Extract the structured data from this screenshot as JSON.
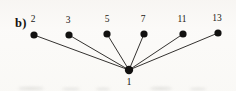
{
  "figure": {
    "panel_label": "b)",
    "panel_label_x": 15,
    "panel_label_y": 17,
    "background_color": "#fbfaf8",
    "ink_color": "#121110",
    "edge_color": "#1d1b18"
  },
  "graph_data": {
    "type": "star-graph",
    "description": "Star graph with center vertex 1 connected to six leaf vertices",
    "center": {
      "id": "center",
      "label": "1",
      "x": 129,
      "y": 70,
      "radius": 4.2,
      "label_x": 129,
      "label_y": 81.5
    },
    "leaves": [
      {
        "id": "leaf-2",
        "label": "2",
        "x": 34,
        "y": 35,
        "radius": 3.6,
        "label_x": 33,
        "label_y": 20
      },
      {
        "id": "leaf-3",
        "label": "3",
        "x": 69,
        "y": 35,
        "radius": 3.6,
        "label_x": 68,
        "label_y": 21
      },
      {
        "id": "leaf-5",
        "label": "5",
        "x": 107,
        "y": 34,
        "radius": 3.6,
        "label_x": 107,
        "label_y": 20
      },
      {
        "id": "leaf-7",
        "label": "7",
        "x": 144,
        "y": 34,
        "radius": 3.6,
        "label_x": 143,
        "label_y": 20
      },
      {
        "id": "leaf-11",
        "label": "11",
        "x": 183,
        "y": 34,
        "radius": 3.6,
        "label_x": 182,
        "label_y": 20
      },
      {
        "id": "leaf-13",
        "label": "13",
        "x": 218,
        "y": 33,
        "radius": 3.6,
        "label_x": 217,
        "label_y": 19
      }
    ],
    "edges": [
      {
        "id": "edge-1-2",
        "from": "1",
        "to": "2"
      },
      {
        "id": "edge-1-3",
        "from": "1",
        "to": "3"
      },
      {
        "id": "edge-1-5",
        "from": "1",
        "to": "5"
      },
      {
        "id": "edge-1-7",
        "from": "1",
        "to": "7"
      },
      {
        "id": "edge-1-11",
        "from": "1",
        "to": "11"
      },
      {
        "id": "edge-1-13",
        "from": "1",
        "to": "13"
      }
    ],
    "edge_width": 0.9,
    "vertex_labels": [
      "1",
      "2",
      "3",
      "5",
      "7",
      "11",
      "13"
    ]
  },
  "artifacts": [
    {
      "x": 18,
      "y": 87,
      "w": 26,
      "h": 3
    },
    {
      "x": 62,
      "y": 88,
      "w": 18,
      "h": 2
    },
    {
      "x": 96,
      "y": 88,
      "w": 14,
      "h": 2
    },
    {
      "x": 150,
      "y": 87,
      "w": 22,
      "h": 3
    },
    {
      "x": 190,
      "y": 88,
      "w": 16,
      "h": 2
    }
  ]
}
